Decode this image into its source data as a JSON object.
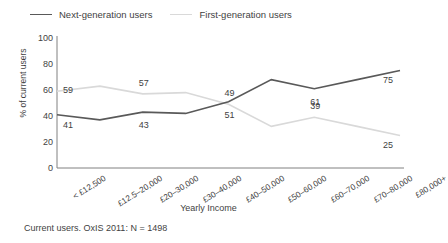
{
  "legend": {
    "items": [
      {
        "label": "Next-generation users",
        "color": "#595959",
        "swatch": "line-swatch-dark"
      },
      {
        "label": "First-generation users",
        "color": "#d9d9d9",
        "swatch": "line-swatch-light"
      }
    ]
  },
  "caption": "Current users. OxIS 2011: N = 1498",
  "chart_data": {
    "type": "line",
    "title": "",
    "xlabel": "Yearly Income",
    "ylabel": "% of current users",
    "ylim": [
      0,
      100
    ],
    "yticks": [
      0,
      20,
      40,
      60,
      80,
      100
    ],
    "grid": false,
    "legend_position": "top-left",
    "categories": [
      "< £12,500",
      "£12.5–20,000",
      "£20–30,000",
      "£30–40,000",
      "£40–50,000",
      "£50–60,000",
      "£60–70,000",
      "£70–80,000",
      "£80,000+"
    ],
    "series": [
      {
        "name": "Next-generation users",
        "color": "#595959",
        "values": [
          41,
          37,
          43,
          42,
          51,
          68,
          61,
          68,
          75
        ],
        "labels": [
          {
            "index": 0,
            "text": "41"
          },
          {
            "index": 2,
            "text": "43"
          },
          {
            "index": 4,
            "text": "51"
          },
          {
            "index": 6,
            "text": "61"
          },
          {
            "index": 8,
            "text": "75"
          }
        ]
      },
      {
        "name": "First-generation users",
        "color": "#d9d9d9",
        "values": [
          59,
          63,
          57,
          58,
          49,
          32,
          39,
          32,
          25
        ],
        "labels": [
          {
            "index": 0,
            "text": "59"
          },
          {
            "index": 2,
            "text": "57"
          },
          {
            "index": 4,
            "text": "49"
          },
          {
            "index": 6,
            "text": "39"
          },
          {
            "index": 8,
            "text": "25"
          }
        ]
      }
    ]
  }
}
